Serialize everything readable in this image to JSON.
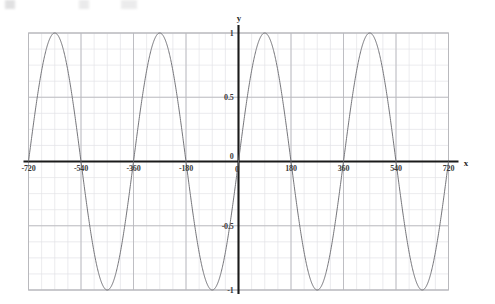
{
  "figure": {
    "title": "",
    "background_color": "#ffffff",
    "width": 495,
    "height": 304
  },
  "axes": {
    "x_label": "x",
    "y_label": "y",
    "origin_label": "0",
    "x_tick_labels": [
      "-720",
      "-540",
      "-360",
      "-180",
      "0",
      "180",
      "360",
      "540",
      "720"
    ],
    "y_tick_labels": [
      "1",
      "0.5",
      "-0.5",
      "-1"
    ],
    "axis_color": "#1a1a1a",
    "grid_major_color": "#b9b9bd",
    "grid_minor_color": "#e2e2e6",
    "curve_color": "#6e6e73"
  },
  "chart_data": {
    "type": "line",
    "title": "",
    "xlabel": "x",
    "ylabel": "y",
    "xlim": [
      -720,
      720
    ],
    "ylim": [
      -1,
      1
    ],
    "grid": true,
    "legend": null,
    "x_ticks": [
      -720,
      -540,
      -360,
      -180,
      0,
      180,
      360,
      540,
      720
    ],
    "y_ticks": [
      -1,
      -0.5,
      0,
      0.5,
      1
    ],
    "x_minor_step": 45,
    "y_minor_step": 0.125,
    "series": [
      {
        "name": "y = sin(x)",
        "function": "sin",
        "amplitude": 1,
        "period_degrees": 360,
        "phase_degrees": 0,
        "x": [
          -720,
          -675,
          -630,
          -585,
          -540,
          -495,
          -450,
          -405,
          -360,
          -315,
          -270,
          -225,
          -180,
          -135,
          -90,
          -45,
          0,
          45,
          90,
          135,
          180,
          225,
          270,
          315,
          360,
          405,
          450,
          495,
          540,
          585,
          630,
          675,
          720
        ],
        "values": [
          0,
          0.707,
          1,
          0.707,
          0,
          -0.707,
          -1,
          -0.707,
          0,
          0.707,
          1,
          0.707,
          0,
          -0.707,
          -1,
          -0.707,
          0,
          0.707,
          1,
          0.707,
          0,
          -0.707,
          -1,
          -0.707,
          0,
          0.707,
          1,
          0.707,
          0,
          -0.707,
          -1,
          -0.707,
          0
        ]
      }
    ],
    "maxima_x": [
      -630,
      -270,
      90,
      450
    ],
    "minima_x": [
      -450,
      -90,
      270,
      630
    ],
    "zeros_x": [
      -720,
      -540,
      -360,
      -180,
      0,
      180,
      360,
      540,
      720
    ]
  }
}
